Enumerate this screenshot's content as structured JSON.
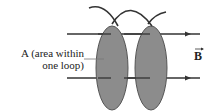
{
  "diagram": {
    "label_area_line1": "A (area within",
    "label_area_line2": "one loop)",
    "field_label": "B",
    "colors": {
      "loop_fill": "#8a8a8a",
      "wire": "#333333",
      "field_lines": "#333333"
    }
  }
}
